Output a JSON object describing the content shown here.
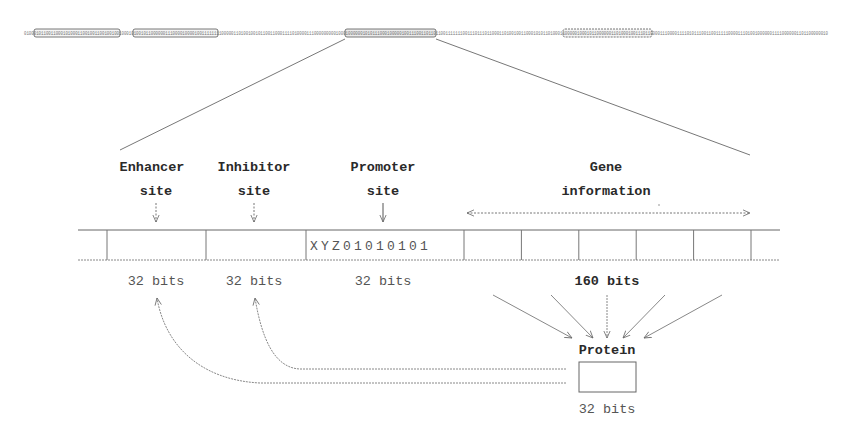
{
  "diagram": {
    "genome_strip": {
      "description": "binary genome string",
      "highlighted_regions": 4,
      "zoomed_region_index": 2
    },
    "labels": {
      "enhancer": [
        "Enhancer",
        "site"
      ],
      "inhibitor": [
        "Inhibitor",
        "site"
      ],
      "promoter": [
        "Promoter",
        "site"
      ],
      "gene": [
        "Gene",
        "information"
      ]
    },
    "segments": {
      "promoter_sequence": "XYZ01010101",
      "enhancer_size": "32 bits",
      "inhibitor_size": "32 bits",
      "promoter_size": "32 bits",
      "gene_size": "160 bits",
      "gene_subdivisions": 5
    },
    "protein": {
      "label": "Protein",
      "size": "32 bits"
    },
    "colors": {
      "line": "#666666",
      "text": "#2a2a2a",
      "strip_box": "#555555"
    }
  }
}
